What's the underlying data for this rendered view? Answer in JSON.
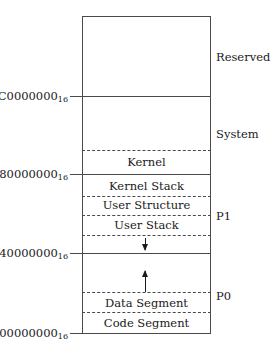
{
  "diagram": {
    "box": {
      "fill_reserved": "#d2d2d2",
      "stroke": "#4a4a4a"
    },
    "address_labels": [
      {
        "id": "addr-c0000000",
        "value": "C0000000",
        "subscript": "16"
      },
      {
        "id": "addr-80000000",
        "value": "80000000",
        "subscript": "16"
      },
      {
        "id": "addr-40000000",
        "value": "40000000",
        "subscript": "16"
      },
      {
        "id": "addr-00000000",
        "value": "00000000",
        "subscript": "16"
      }
    ],
    "region_labels": [
      {
        "id": "region-kernel",
        "label": "Kernel"
      },
      {
        "id": "region-kernel-stack",
        "label": "Kernel Stack"
      },
      {
        "id": "region-user-structure",
        "label": "User Structure"
      },
      {
        "id": "region-user-stack",
        "label": "User Stack"
      },
      {
        "id": "region-data-segment",
        "label": "Data Segment"
      },
      {
        "id": "region-code-segment",
        "label": "Code Segment"
      }
    ],
    "side_labels": [
      {
        "id": "side-reserved",
        "label": "Reserved"
      },
      {
        "id": "side-system",
        "label": "System"
      },
      {
        "id": "side-p1",
        "label": "P1"
      },
      {
        "id": "side-p0",
        "label": "P0"
      }
    ],
    "arrows": [
      {
        "id": "arrow-user-stack-growth",
        "direction": "down"
      },
      {
        "id": "arrow-heap-growth",
        "direction": "up"
      }
    ]
  }
}
